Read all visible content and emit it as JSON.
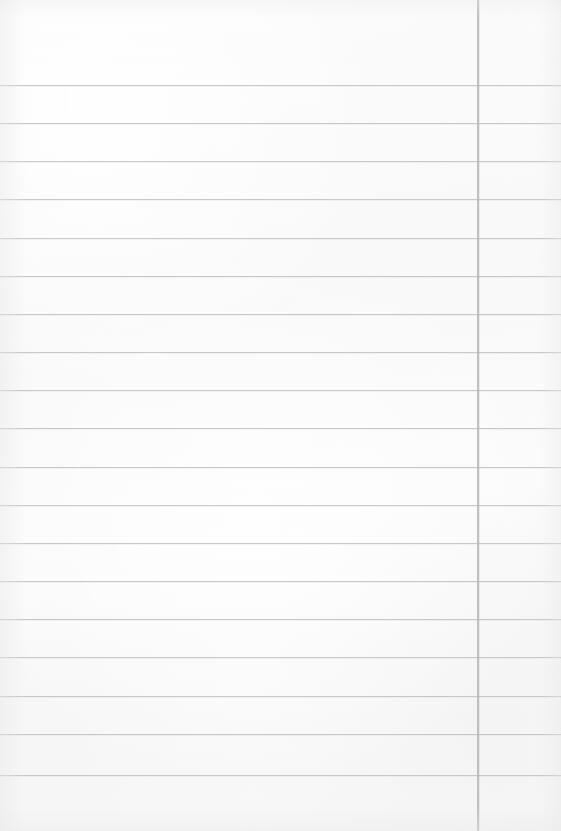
{
  "page": {
    "kind": "blank-ruled-notebook-paper",
    "width": 561,
    "height": 831,
    "background_color": "#fbfbfa",
    "has_text_content": false,
    "written_text": "",
    "handwriting": "",
    "typed_text": ""
  },
  "ruling": {
    "rule_color": "#b9bdc0",
    "margin_color": "#b2b6ba",
    "line_count": 19,
    "first_line_y": 85,
    "line_spacing": 38.3,
    "rule_thickness": 1,
    "margin_thickness": 2,
    "margin_x": 477,
    "margin_orientation": "vertical",
    "margin_spans_full_height": true,
    "horizontal_lines_y": [
      85,
      123,
      161,
      199,
      238,
      276,
      314,
      352,
      390,
      428,
      467,
      505,
      543,
      581,
      619,
      657,
      696,
      734,
      775
    ]
  },
  "content": {
    "lines": [
      {
        "index": 1,
        "text": ""
      },
      {
        "index": 2,
        "text": ""
      },
      {
        "index": 3,
        "text": ""
      },
      {
        "index": 4,
        "text": ""
      },
      {
        "index": 5,
        "text": ""
      },
      {
        "index": 6,
        "text": ""
      },
      {
        "index": 7,
        "text": ""
      },
      {
        "index": 8,
        "text": ""
      },
      {
        "index": 9,
        "text": ""
      },
      {
        "index": 10,
        "text": ""
      },
      {
        "index": 11,
        "text": ""
      },
      {
        "index": 12,
        "text": ""
      },
      {
        "index": 13,
        "text": ""
      },
      {
        "index": 14,
        "text": ""
      },
      {
        "index": 15,
        "text": ""
      },
      {
        "index": 16,
        "text": ""
      },
      {
        "index": 17,
        "text": ""
      },
      {
        "index": 18,
        "text": ""
      },
      {
        "index": 19,
        "text": ""
      },
      {
        "index": 20,
        "text": ""
      }
    ]
  }
}
